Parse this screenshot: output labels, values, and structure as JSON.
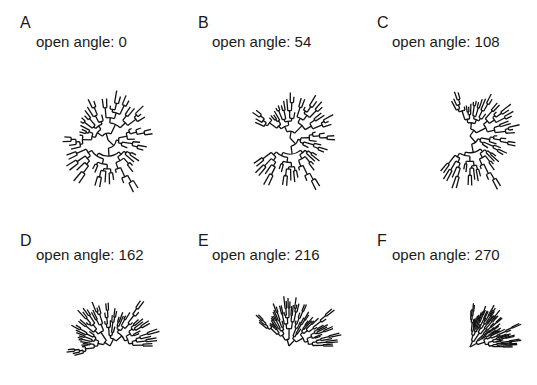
{
  "chart_data": {
    "type": "tree",
    "layout": "fan",
    "line_color": "#111111",
    "text_color": "#1a1a1a",
    "panels": [
      {
        "label": "A",
        "title": "open angle: 0",
        "open_angle": 0
      },
      {
        "label": "B",
        "title": "open angle: 54",
        "open_angle": 54
      },
      {
        "label": "C",
        "title": "open angle: 108",
        "open_angle": 108
      },
      {
        "label": "D",
        "title": "open angle: 162",
        "open_angle": 162
      },
      {
        "label": "E",
        "title": "open angle: 216",
        "open_angle": 216
      },
      {
        "label": "F",
        "title": "open angle: 270",
        "open_angle": 270
      }
    ],
    "tree": {
      "tips": 60,
      "branch_lengths": "random",
      "seed": 42
    }
  }
}
